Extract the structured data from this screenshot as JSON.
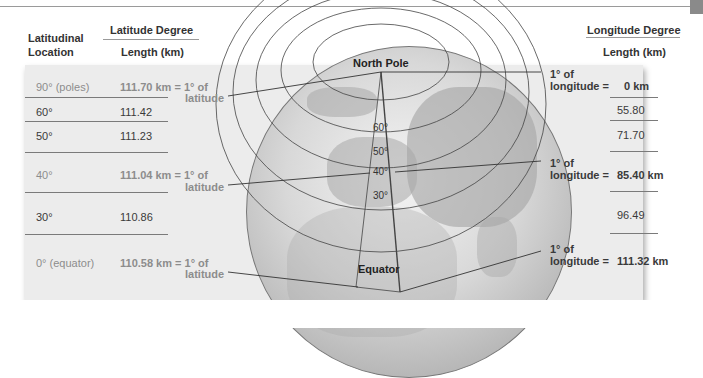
{
  "headers": {
    "latitudinal_location": [
      "Latitudinal",
      "Location"
    ],
    "latitude_degree": "Latitude Degree",
    "latitude_length": "Length (km)",
    "longitude_degree": "Longitude Degree",
    "longitude_length": "Length (km)"
  },
  "latitude_rows": [
    {
      "location": "90° (poles)",
      "value": "111.70 km = 1° of",
      "suffix": "latitude"
    },
    {
      "location": "60°",
      "value": "111.42"
    },
    {
      "location": "50°",
      "value": "111.23"
    },
    {
      "location": "40°",
      "value": "111.04 km = 1° of",
      "suffix": "latitude"
    },
    {
      "location": "30°",
      "value": "110.86"
    },
    {
      "location": "0° (equator)",
      "value": "110.58 km = 1° of",
      "suffix": "latitude"
    }
  ],
  "longitude_rows": [
    {
      "prefix": [
        "1° of",
        "longitude ="
      ],
      "value": "0 km"
    },
    {
      "value": "55.80"
    },
    {
      "value": "71.70"
    },
    {
      "prefix": [
        "1° of",
        "longitude ="
      ],
      "value": "85.40 km"
    },
    {
      "value": "96.49"
    },
    {
      "prefix": [
        "1° of",
        "longitude ="
      ],
      "value": "111.32 km"
    }
  ],
  "globe": {
    "north_pole": "North Pole",
    "equator": "Equator",
    "parallels": [
      "60°",
      "50°",
      "40°",
      "30°"
    ]
  }
}
